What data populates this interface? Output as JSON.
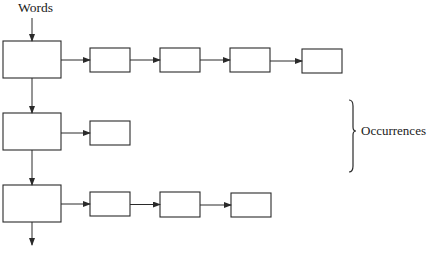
{
  "diagram": {
    "type": "linked-list-index",
    "labels": {
      "words": "Words",
      "occurrences": "Occurrences"
    },
    "colors": {
      "stroke": "#2a2a2a",
      "background": "#ffffff"
    },
    "word_nodes": [
      {
        "id": "word-1",
        "x": 3,
        "y": 41,
        "w": 58,
        "h": 37
      },
      {
        "id": "word-2",
        "x": 3,
        "y": 113,
        "w": 58,
        "h": 37
      },
      {
        "id": "word-3",
        "x": 3,
        "y": 185,
        "w": 58,
        "h": 37
      }
    ],
    "occurrence_rows": [
      {
        "row": 1,
        "nodes": [
          {
            "x": 90,
            "y": 48,
            "w": 40,
            "h": 24
          },
          {
            "x": 160,
            "y": 48,
            "w": 40,
            "h": 24
          },
          {
            "x": 230,
            "y": 48,
            "w": 40,
            "h": 24
          },
          {
            "x": 302,
            "y": 49,
            "w": 40,
            "h": 24
          }
        ]
      },
      {
        "row": 2,
        "nodes": [
          {
            "x": 90,
            "y": 121,
            "w": 40,
            "h": 24
          }
        ]
      },
      {
        "row": 3,
        "nodes": [
          {
            "x": 90,
            "y": 192,
            "w": 40,
            "h": 24
          },
          {
            "x": 160,
            "y": 192,
            "w": 40,
            "h": 25
          },
          {
            "x": 231,
            "y": 193,
            "w": 40,
            "h": 24
          }
        ]
      }
    ],
    "brace": {
      "x": 353,
      "y_top": 100,
      "y_bottom": 172,
      "y_mid": 131
    }
  }
}
